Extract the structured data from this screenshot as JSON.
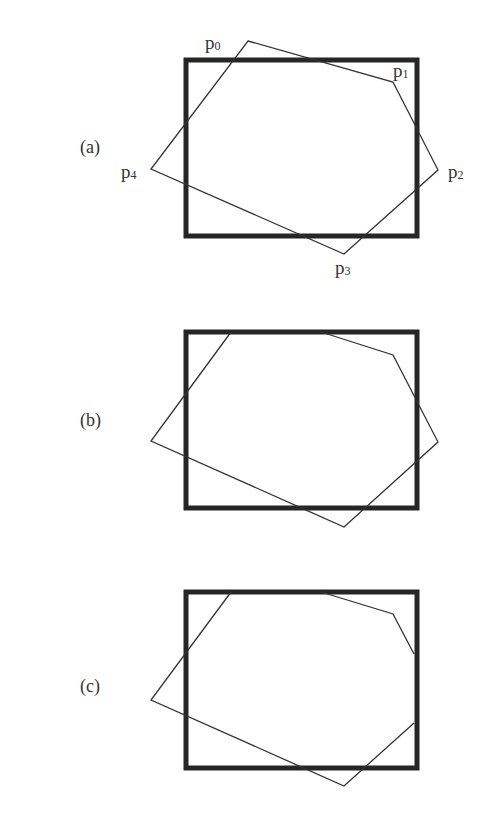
{
  "figure": {
    "colors": {
      "clip_rect": "#262626",
      "polygon": "#333333",
      "text": "#333333",
      "background": "#ffffff"
    },
    "panels": [
      {
        "label": "(a)",
        "clip_rect": {
          "x": 186,
          "y": 60,
          "w": 231,
          "h": 176
        },
        "polygon": "248,41 393,82 438,170 344,254 151,169",
        "vertices": [
          {
            "name": "p",
            "sub": "0"
          },
          {
            "name": "p",
            "sub": "1"
          },
          {
            "name": "p",
            "sub": "2"
          },
          {
            "name": "p",
            "sub": "3"
          },
          {
            "name": "p",
            "sub": "4"
          }
        ]
      },
      {
        "label": "(b)",
        "clip_rect": {
          "x": 186,
          "y": 332,
          "w": 231,
          "h": 176
        },
        "polygon": "231,332 151,441 344,527 438,442 393,355 321,332"
      },
      {
        "label": "(c)",
        "clip_rect": {
          "x": 186,
          "y": 592,
          "w": 231,
          "h": 176
        },
        "polygon": "231,592 151,700 344,786 414,723 414,654 393,614 321,592"
      }
    ]
  }
}
